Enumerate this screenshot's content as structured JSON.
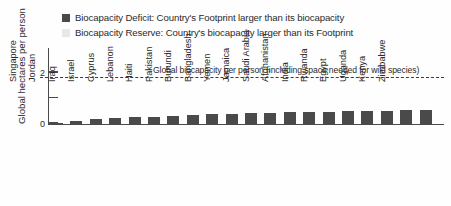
{
  "legend": {
    "items": [
      {
        "swatch_color": "#4a4a4a",
        "label": "Biocapacity Deficit: Country's Footprint larger than its biocapacity"
      },
      {
        "swatch_color": "#e8e8e8",
        "label": "Biocapacity Reserve: Country's biocapacity larger than its Footprint"
      }
    ]
  },
  "axis": {
    "y_title": "Global hectares per person",
    "y_ticks": [
      {
        "value": 0,
        "label": "0"
      },
      {
        "value": 1,
        "label": ""
      },
      {
        "value": 2,
        "label": "2"
      }
    ]
  },
  "annotation": {
    "text": "Global biocapacity per person (including space needed for wild species)",
    "value": 1.78
  },
  "colors": {
    "bar": "#4a4a4a",
    "axis": "#4a4a4a",
    "dashed_line": "#3a3a3a",
    "text": "#2b2b2b"
  },
  "chart_data": {
    "type": "bar",
    "title": "",
    "subtitle": "",
    "xlabel": "",
    "ylabel": "Global hectares per person",
    "ylim": [
      0,
      2.95
    ],
    "grid": false,
    "legend_position": "top",
    "categories": [
      "Singapore",
      "Jordan",
      "Iraq",
      "Israel",
      "Cyprus",
      "Lebanon",
      "Haiti",
      "Pakistan",
      "Burundi",
      "Bangladesh",
      "Yemen",
      "Jamaica",
      "Saudi Arabia",
      "Afghanistan",
      "India",
      "Rwanda",
      "Egypt",
      "Uganda",
      "Kenya",
      "Zimbabwe"
    ],
    "values": [
      0.03,
      0.11,
      0.17,
      0.21,
      0.25,
      0.28,
      0.3,
      0.33,
      0.36,
      0.38,
      0.4,
      0.42,
      0.44,
      0.45,
      0.46,
      0.48,
      0.49,
      0.5,
      0.52,
      0.53
    ],
    "series": [
      {
        "name": "Biocapacity Deficit: Country's Footprint larger than its biocapacity",
        "values": [
          0.03,
          0.11,
          0.17,
          0.21,
          0.25,
          0.28,
          0.3,
          0.33,
          0.36,
          0.38,
          0.4,
          0.42,
          0.44,
          0.45,
          0.46,
          0.48,
          0.49,
          0.5,
          0.52,
          0.53
        ]
      }
    ],
    "annotations": [
      {
        "type": "hline",
        "value": 1.78,
        "style": "dashed",
        "label": "Global biocapacity per person (including space needed for wild species)"
      }
    ]
  }
}
